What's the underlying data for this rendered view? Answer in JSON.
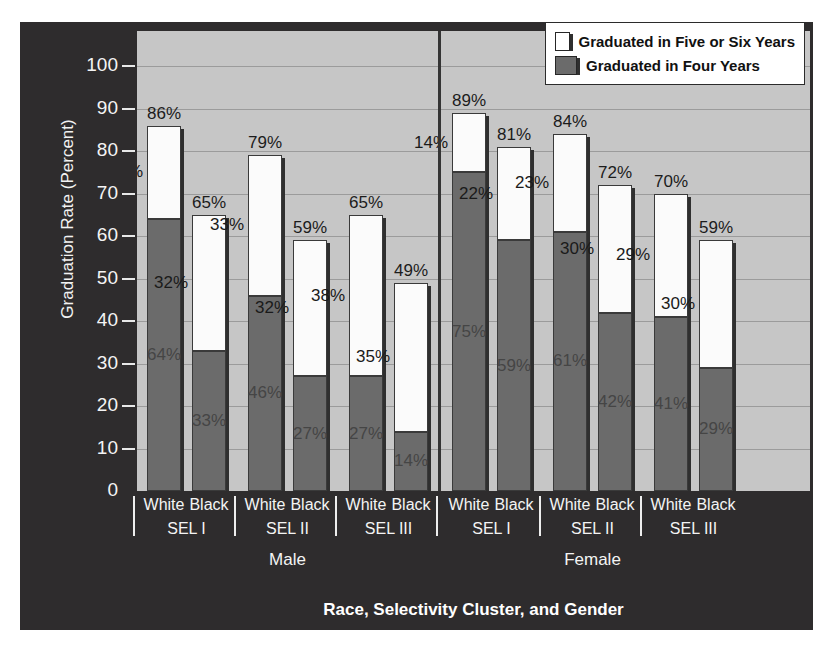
{
  "chart_data": {
    "type": "bar",
    "subtype": "stacked",
    "title": "",
    "xlabel": "Race, Selectivity Cluster, and Gender",
    "ylabel": "Graduation Rate (Percent)",
    "ylim": [
      0,
      100
    ],
    "yticks": [
      "0",
      "10",
      "20",
      "30",
      "40",
      "50",
      "60",
      "70",
      "80",
      "90",
      "100"
    ],
    "grid": true,
    "legend_position": "top-right",
    "legend": [
      {
        "label": "Graduated in Five or Six Years",
        "color": "#ffffff",
        "swatch": "white"
      },
      {
        "label": "Graduated in Four Years",
        "color": "#6b6b6b",
        "swatch": "dark"
      }
    ],
    "series": [
      {
        "name": "Graduated in Four Years",
        "values": [
          64,
          33,
          46,
          27,
          27,
          14,
          75,
          59,
          61,
          42,
          41,
          29
        ]
      },
      {
        "name": "Graduated in Five or Six Years",
        "values": [
          22,
          32,
          33,
          32,
          38,
          35,
          14,
          22,
          23,
          30,
          29,
          30
        ]
      }
    ],
    "totals": [
      86,
      65,
      79,
      59,
      65,
      49,
      89,
      81,
      84,
      72,
      70,
      59
    ],
    "categories": [
      "Male / SEL I / White",
      "Male / SEL I / Black",
      "Male / SEL II / White",
      "Male / SEL II / Black",
      "Male / SEL III / White",
      "Male / SEL III / Black",
      "Female / SEL I / White",
      "Female / SEL I / Black",
      "Female / SEL II / White",
      "Female / SEL II / Black",
      "Female / SEL III / White",
      "Female / SEL III / Black"
    ],
    "bars": [
      {
        "race": "White",
        "cluster": "SEL I",
        "gender": "Male",
        "four": 64,
        "five_six": 22,
        "total": 86,
        "label_total": "86%",
        "label_top": "22%",
        "label_bot": "64%"
      },
      {
        "race": "Black",
        "cluster": "SEL I",
        "gender": "Male",
        "four": 33,
        "five_six": 32,
        "total": 65,
        "label_total": "65%",
        "label_top": "32%",
        "label_bot": "33%"
      },
      {
        "race": "White",
        "cluster": "SEL II",
        "gender": "Male",
        "four": 46,
        "five_six": 33,
        "total": 79,
        "label_total": "79%",
        "label_top": "33%",
        "label_bot": "46%"
      },
      {
        "race": "Black",
        "cluster": "SEL II",
        "gender": "Male",
        "four": 27,
        "five_six": 32,
        "total": 59,
        "label_total": "59%",
        "label_top": "32%",
        "label_bot": "27%"
      },
      {
        "race": "White",
        "cluster": "SEL III",
        "gender": "Male",
        "four": 27,
        "five_six": 38,
        "total": 65,
        "label_total": "65%",
        "label_top": "38%",
        "label_bot": "27%"
      },
      {
        "race": "Black",
        "cluster": "SEL III",
        "gender": "Male",
        "four": 14,
        "five_six": 35,
        "total": 49,
        "label_total": "49%",
        "label_top": "35%",
        "label_bot": "14%"
      },
      {
        "race": "White",
        "cluster": "SEL I",
        "gender": "Female",
        "four": 75,
        "five_six": 14,
        "total": 89,
        "label_total": "89%",
        "label_top": "14%",
        "label_bot": "75%"
      },
      {
        "race": "Black",
        "cluster": "SEL I",
        "gender": "Female",
        "four": 59,
        "five_six": 22,
        "total": 81,
        "label_total": "81%",
        "label_top": "22%",
        "label_bot": "59%"
      },
      {
        "race": "White",
        "cluster": "SEL II",
        "gender": "Female",
        "four": 61,
        "five_six": 23,
        "total": 84,
        "label_total": "84%",
        "label_top": "23%",
        "label_bot": "61%"
      },
      {
        "race": "Black",
        "cluster": "SEL II",
        "gender": "Female",
        "four": 42,
        "five_six": 30,
        "total": 72,
        "label_total": "72%",
        "label_top": "30%",
        "label_bot": "42%"
      },
      {
        "race": "White",
        "cluster": "SEL III",
        "gender": "Female",
        "four": 41,
        "five_six": 29,
        "total": 70,
        "label_total": "70%",
        "label_top": "29%",
        "label_bot": "41%"
      },
      {
        "race": "Black",
        "cluster": "SEL III",
        "gender": "Female",
        "four": 29,
        "five_six": 30,
        "total": 59,
        "label_total": "59%",
        "label_top": "30%",
        "label_bot": "29%"
      }
    ],
    "x_clusters": [
      "SEL I",
      "SEL II",
      "SEL III",
      "SEL I",
      "SEL II",
      "SEL III"
    ],
    "x_genders": [
      "Male",
      "Female"
    ],
    "colors": {
      "figure_background": "#2e2c2d",
      "plot_background": "#c6c6c6",
      "gridline": "#9b9b9b",
      "bar_four_years": "#6b6b6b",
      "bar_five_six_years": "#ffffff",
      "axis_text": "#f4f4f4",
      "bar_outline": "#3a3a3a"
    }
  }
}
